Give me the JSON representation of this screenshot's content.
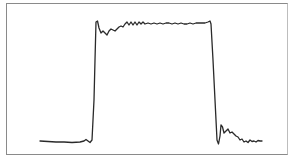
{
  "diagram": {
    "type": "waveform",
    "colors": {
      "trace": "#2a2a2a",
      "border": "#8a8a8a",
      "background": "#ffffff"
    },
    "trace_points": "40,141 48,141.5 56,142 64,142 72,142.5 80,142 84,141 86,139.5 88,141 90,142.5 92,140 94,100 95,60 96,22 97.5,21 99,28 101,33 103,31 105,33 107,35 109,31 111,29 113,30 115,31 117,29 119,27 121,26 123,27 125,24 127,22 129,25 131,22 133,25 135,22 137,25 139,22 141,24 143,22 145,24 148,23 151,24 154,23 157,24 160,23 163,24 166,23 169,23 172,24 175,23 178,24 181,23 184,24 187,24 190,23 193,24 196,23 199,23 202,23 205,23 208,22 210,21 211,24 213,60 215,100 217,140 218.5,144 220,136 221,125 222.5,127 224,133 226,131 228,129 230,133 232,132 234,134 236,136 238,137 240,140 242,139 244,142 246,141 248,142.5 250,140 252,141.5 254,141 256,142 258,140.5 260,141 262,141"
  }
}
